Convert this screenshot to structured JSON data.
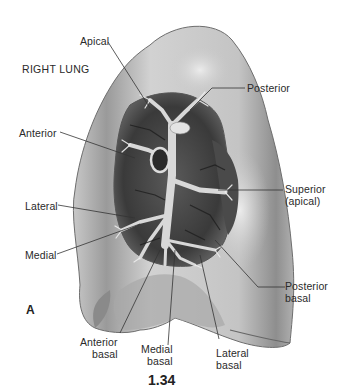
{
  "title": "RIGHT LUNG",
  "panel_letter": "A",
  "figure_number": "1.34",
  "labels": {
    "apical": "Apical",
    "posterior": "Posterior",
    "anterior": "Anterior",
    "superior_line1": "Superior",
    "superior_line2": "(apical)",
    "lateral": "Lateral",
    "medial": "Medial",
    "posterior_basal_line1": "Posterior",
    "posterior_basal_line2": "basal",
    "anterior_basal_line1": "Anterior",
    "anterior_basal_line2": "basal",
    "medial_basal_line1": "Medial",
    "medial_basal_line2": "basal",
    "lateral_basal_line1": "Lateral",
    "lateral_basal_line2": "basal"
  },
  "colors": {
    "lung_fill": "#bdbdbd",
    "lung_light": "#dcdcdc",
    "lung_dark": "#7a7a7a",
    "airway_dark": "#2b2b2b",
    "leader_line": "#333333"
  }
}
